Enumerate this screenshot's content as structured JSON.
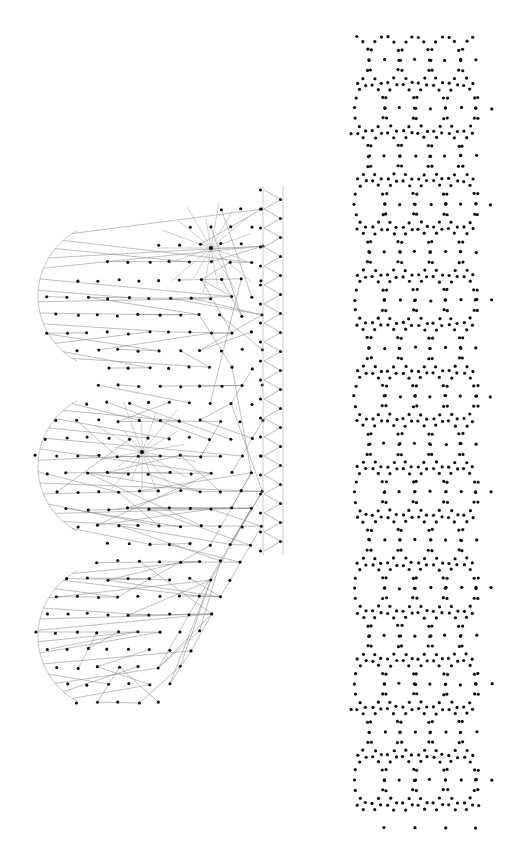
{
  "document": {
    "title": "Generative Dot and Line Composition",
    "background_color": "#ffffff",
    "width": 513,
    "height": 844
  },
  "palette": {
    "dot_color": "#111111",
    "line_color": "#8a8a8a",
    "arc_color": "#9a9a9a",
    "rail_color": "#b4b4b4",
    "background": "#ffffff"
  },
  "chart_data": {
    "type": "scatter",
    "xlabel": "",
    "ylabel": "",
    "xlim": [
      0,
      513
    ],
    "ylim": [
      0,
      844
    ],
    "grid": false,
    "legend": false,
    "panels": [
      {
        "name": "left-fan-panel",
        "bounds": [
          18,
          185,
          290,
          715
        ],
        "elements": [
          "dot-lattice",
          "connector-fan",
          "left-arcs",
          "starburst-nodes",
          "zigzag-rail"
        ]
      },
      {
        "name": "right-lattice-panel",
        "bounds": [
          352,
          34,
          478,
          812
        ],
        "elements": [
          "periodic-dot-lattice"
        ]
      }
    ]
  },
  "left_panel": {
    "name": "left-fan-panel",
    "lattice": {
      "origin_x": 26,
      "origin_y": 192,
      "dx": 20.5,
      "dy": 17.6,
      "cols": 13,
      "rows": 31,
      "stagger": 0.5,
      "dot_radius": 1.55,
      "boundary_note": "lattice clipped to a leftward-bulging three-lobe outline"
    },
    "arcs": [
      {
        "cx": 112,
        "cy": 296,
        "r": 74,
        "a0": 118,
        "a1": 242
      },
      {
        "cx": 112,
        "cy": 466,
        "r": 74,
        "a0": 118,
        "a1": 242
      },
      {
        "cx": 112,
        "cy": 636,
        "r": 74,
        "a0": 118,
        "a1": 242
      }
    ],
    "starbursts": [
      {
        "cx": 211,
        "cy": 248,
        "rays": 18,
        "r_min": 26,
        "r_max": 56,
        "hub_radius": 2.1
      },
      {
        "cx": 142,
        "cy": 452,
        "rays": 18,
        "r_min": 26,
        "r_max": 56,
        "hub_radius": 2.1
      }
    ],
    "fan": {
      "segment_count": 150,
      "angle_bias_deg": 8,
      "length_min": 18,
      "length_max": 132,
      "note": "each segment starts at a lattice dot and runs mostly rightward to a distant lattice dot"
    },
    "rail_strip": {
      "x_left": 263,
      "x_right": 283,
      "y_top": 190,
      "y_bottom": 551,
      "zigzag_periods": 19,
      "dots_per_side": 20,
      "dot_radius": 1.5
    }
  },
  "right_panel": {
    "name": "right-lattice-panel",
    "lattice": {
      "x_left": 354,
      "x_right": 476,
      "y_top": 36,
      "y_bottom": 810,
      "cell_w": 30.5,
      "cell_h": 48,
      "ring_points": 14,
      "ring_rx": 15.0,
      "ring_ry": 23.5,
      "dot_radius": 1.6,
      "columns": 4,
      "rows": 16,
      "note": "overlapping elliptical rings of dots forming an interlocking diamond/ogee lattice; density increases toward the right edge"
    }
  },
  "labels": {
    "left_panel_caption": "",
    "right_panel_caption": "",
    "figure_caption": ""
  }
}
